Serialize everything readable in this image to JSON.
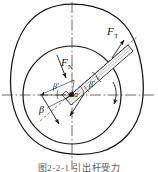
{
  "figure": {
    "caption": "图2-2-1  引出杆受力",
    "labels": {
      "force_tangential": {
        "symbol": "F",
        "subscript": "T"
      },
      "force_normal": {
        "symbol": "F",
        "subscript": "N"
      },
      "angle_alpha": "α",
      "angle_beta_prime": "β′",
      "angle_beta_right": "β′",
      "angle_beta_lower": "β"
    },
    "colors": {
      "line": "#141414",
      "centerline": "#3a3a3a",
      "hatch": "#8d8d8d",
      "caption": "#5a5a5a",
      "background": "#ffffff"
    },
    "elements": {
      "outer_contour": "cam-outline",
      "inner_circle": "roller-circle",
      "rod": "hatched-connecting-rod",
      "pivot": "center-pivot-marker",
      "rotation_arrow": "rotation-direction-arrow",
      "horizontal_centerline": "horizontal-axis",
      "vertical_centerline": "vertical-axis"
    }
  }
}
